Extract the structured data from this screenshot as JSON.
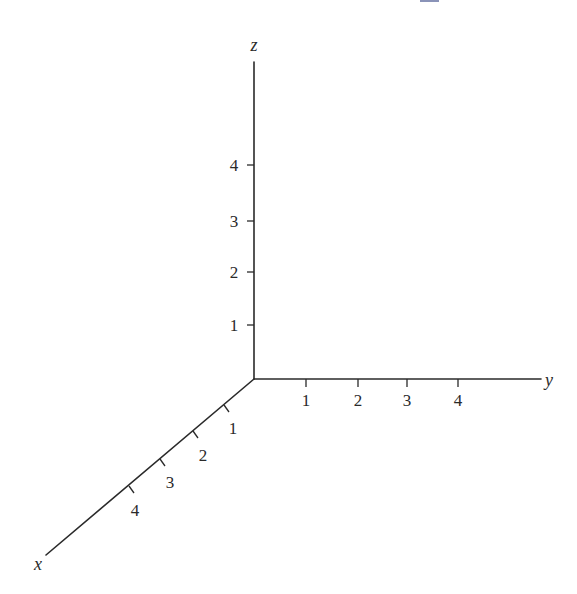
{
  "diagram": {
    "type": "3d-coordinate-axes",
    "axes": {
      "x": {
        "label": "x",
        "ticks": [
          "1",
          "2",
          "3",
          "4"
        ]
      },
      "y": {
        "label": "y",
        "ticks": [
          "1",
          "2",
          "3",
          "4"
        ]
      },
      "z": {
        "label": "z",
        "ticks": [
          "1",
          "2",
          "3",
          "4"
        ]
      }
    },
    "colors": {
      "line": "#2a2a2a",
      "top_marker": "#8a93b8"
    }
  }
}
